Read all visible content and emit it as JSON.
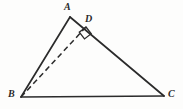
{
  "figure": {
    "background_color": "#fdfdfc",
    "stroke_color": "#2b2b2b",
    "label_color": "#2a2a2a"
  },
  "vertices": {
    "A": {
      "label": "A",
      "x": 70,
      "y": 17
    },
    "B": {
      "label": "B",
      "x": 21,
      "y": 97
    },
    "C": {
      "label": "C",
      "x": 164,
      "y": 96
    },
    "D": {
      "label": "D",
      "x": 86,
      "y": 27
    }
  },
  "segments": [
    {
      "name": "side-AB",
      "from": "A",
      "to": "B",
      "style": "solid",
      "x1": 70,
      "y1": 17,
      "x2": 21,
      "y2": 97
    },
    {
      "name": "side-AC",
      "from": "A",
      "to": "C",
      "style": "solid",
      "x1": 70,
      "y1": 17,
      "x2": 164,
      "y2": 96
    },
    {
      "name": "side-BC",
      "from": "B",
      "to": "C",
      "style": "solid",
      "x1": 21,
      "y1": 97,
      "x2": 164,
      "y2": 96
    },
    {
      "name": "altitude-BD",
      "from": "B",
      "to": "D",
      "style": "dashed",
      "x1": 21,
      "y1": 97,
      "x2": 86,
      "y2": 27
    }
  ],
  "right_angle": {
    "at": "D",
    "size": 9,
    "points": "86,27 79,32 84,39 91,34"
  }
}
